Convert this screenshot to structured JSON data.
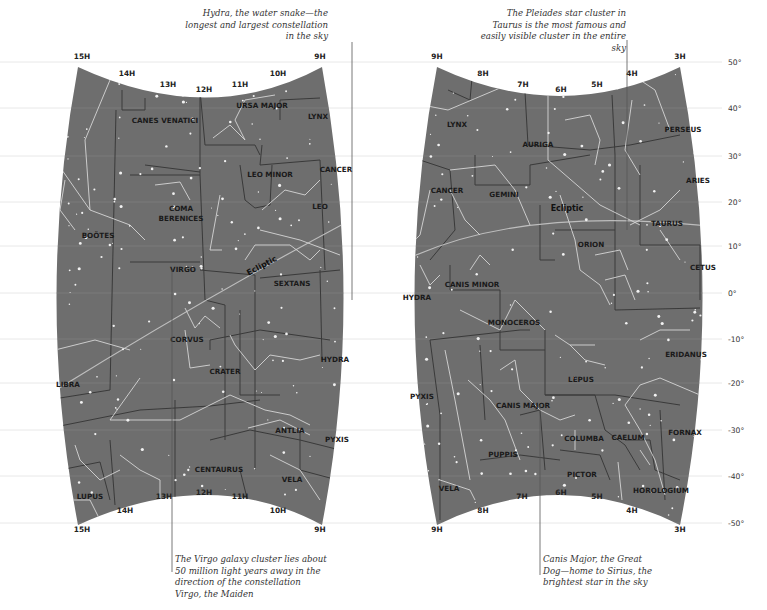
{
  "colors": {
    "sky_fill": "#6e6e6e",
    "constellation_line": "#d6d6d6",
    "boundary_line": "#3a3a3a",
    "ecliptic_line": "#bdbdbd",
    "grid_line": "#e2e2e2",
    "star": "#f2f2f2",
    "annotation_leader": "#555555"
  },
  "declination_labels": [
    "50°",
    "40°",
    "30°",
    "20°",
    "10°",
    "0°",
    "-10°",
    "-20°",
    "-30°",
    "-40°",
    "-50°"
  ],
  "ecliptic_label": "Ecliptic",
  "maps": [
    {
      "id": "left",
      "top_hour_labels": [
        "15H",
        "14H",
        "13H",
        "12H",
        "11H",
        "10H",
        "9H"
      ],
      "bottom_hour_labels": [
        "15H",
        "14H",
        "13H",
        "12H",
        "11H",
        "10H",
        "9H"
      ],
      "constellations": [
        "CANES VENATICI",
        "URSA MAJOR",
        "LYNX",
        "LEO MINOR",
        "CANCER",
        "COMA BERENICES",
        "LEO",
        "BOÖTES",
        "VIRGO",
        "SEXTANS",
        "CORVUS",
        "CRATER",
        "HYDRA",
        "LIBRA",
        "ANTLIA",
        "PYXIS",
        "CENTAURUS",
        "VELA",
        "LUPUS"
      ]
    },
    {
      "id": "right",
      "top_hour_labels": [
        "9H",
        "8H",
        "7H",
        "6H",
        "5H",
        "4H",
        "3H"
      ],
      "bottom_hour_labels": [
        "9H",
        "8H",
        "7H",
        "6H",
        "5H",
        "4H",
        "3H"
      ],
      "constellations": [
        "LYNX",
        "AURIGA",
        "PERSEUS",
        "CANCER",
        "GEMINI",
        "ARIES",
        "TAURUS",
        "ORION",
        "CETUS",
        "HYDRA",
        "CANIS MINOR",
        "MONOCEROS",
        "ERIDANUS",
        "LEPUS",
        "PYXIS",
        "CANIS MAJOR",
        "COLUMBA",
        "CAELUM",
        "FORNAX",
        "PUPPIS",
        "PICTOR",
        "VELA",
        "HOROLOGIUM"
      ]
    }
  ],
  "annotations": {
    "hydra": "Hydra, the water snake—the longest and largest constellation in the sky",
    "pleiades": "The Pleiades star cluster in Taurus is the most famous and easily visible cluster in the entire sky",
    "virgo": "The Virgo galaxy cluster lies about 50 million light years away in the direction of the constellation Virgo, the Maiden",
    "canis_major": "Canis Major, the Great Dog—home to Sirius, the brightest star in the sky"
  }
}
